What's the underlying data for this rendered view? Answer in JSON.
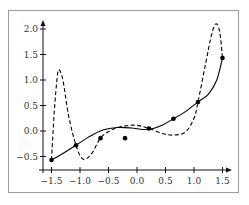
{
  "chart_data": {
    "type": "line",
    "title": "",
    "xlabel": "",
    "ylabel": "",
    "xlim": [
      -1.6,
      1.65
    ],
    "ylim": [
      -0.65,
      2.1
    ],
    "grid": false,
    "legend": null,
    "x_ticks": [
      -1.5,
      -1.0,
      -0.5,
      0.0,
      0.5,
      1.0,
      1.5
    ],
    "x_tick_labels": [
      "−1.5",
      "−1.0",
      "−0.5",
      "0.0",
      "0.5",
      "1.0",
      "1.5"
    ],
    "y_ticks": [
      -0.5,
      0.0,
      0.5,
      1.0,
      1.5,
      2.0
    ],
    "y_tick_labels": [
      "−0.5",
      "0.0",
      "0.5",
      "1.0",
      "1.5",
      "2.0"
    ],
    "series": [
      {
        "name": "data points",
        "style": "scatter",
        "color": "#000000",
        "x": [
          -1.5,
          -1.07,
          -0.64,
          -0.21,
          0.21,
          0.64,
          1.07,
          1.5
        ],
        "y": [
          -0.57,
          -0.28,
          -0.14,
          -0.14,
          0.05,
          0.24,
          0.57,
          1.43
        ]
      },
      {
        "name": "smooth fit",
        "style": "solid",
        "color": "#000000",
        "x": [
          -1.5,
          -1.3,
          -1.07,
          -0.85,
          -0.6,
          -0.35,
          -0.1,
          0.1,
          0.25,
          0.45,
          0.64,
          0.85,
          1.07,
          1.25,
          1.4,
          1.5
        ],
        "y": [
          -0.57,
          -0.44,
          -0.28,
          -0.12,
          0.02,
          0.07,
          0.06,
          0.03,
          0.04,
          0.12,
          0.24,
          0.38,
          0.57,
          0.72,
          1.0,
          1.43
        ]
      },
      {
        "name": "interpolating polynomial",
        "style": "dashed",
        "color": "#000000",
        "x": [
          -1.5,
          -1.45,
          -1.4,
          -1.37,
          -1.3,
          -1.2,
          -1.07,
          -0.95,
          -0.8,
          -0.64,
          -0.45,
          -0.21,
          0.0,
          0.21,
          0.45,
          0.64,
          0.85,
          1.0,
          1.07,
          1.2,
          1.3,
          1.38,
          1.45,
          1.5
        ],
        "y": [
          -0.57,
          0.4,
          1.05,
          1.2,
          1.0,
          0.3,
          -0.28,
          -0.55,
          -0.45,
          -0.14,
          0.02,
          0.1,
          0.11,
          0.05,
          -0.05,
          -0.08,
          -0.02,
          0.25,
          0.57,
          1.3,
          1.85,
          2.1,
          1.95,
          1.43
        ]
      }
    ]
  },
  "axes": {
    "x_axis_arrow": true,
    "y_axis_arrow": true
  }
}
